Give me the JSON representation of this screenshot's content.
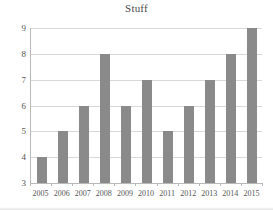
{
  "chart_data": {
    "type": "bar",
    "title": "Stuff",
    "xlabel": "",
    "ylabel": "",
    "categories": [
      "2005",
      "2006",
      "2007",
      "2008",
      "2009",
      "2010",
      "2011",
      "2012",
      "2013",
      "2014",
      "2015"
    ],
    "values": [
      4,
      5,
      6,
      8,
      6,
      7,
      5,
      6,
      7,
      8,
      9
    ],
    "ylim": [
      3,
      9
    ],
    "yticks": [
      3,
      4,
      5,
      6,
      7,
      8,
      9
    ],
    "ytick_labels": [
      "3",
      "4",
      "5",
      "6",
      "7",
      "8",
      "9"
    ],
    "grid": true,
    "grid_axis": "y",
    "legend": false,
    "legend_position": "none",
    "series": [
      {
        "name": "Stuff",
        "values": [
          4,
          5,
          6,
          8,
          6,
          7,
          5,
          6,
          7,
          8,
          9
        ]
      }
    ],
    "colors": {
      "bar": "#8a8a8a",
      "gridline": "#d8d8d8",
      "axis": "#b9b9b9",
      "text": "#555555",
      "title": "#4a4a4a",
      "background": "#ffffff"
    }
  }
}
